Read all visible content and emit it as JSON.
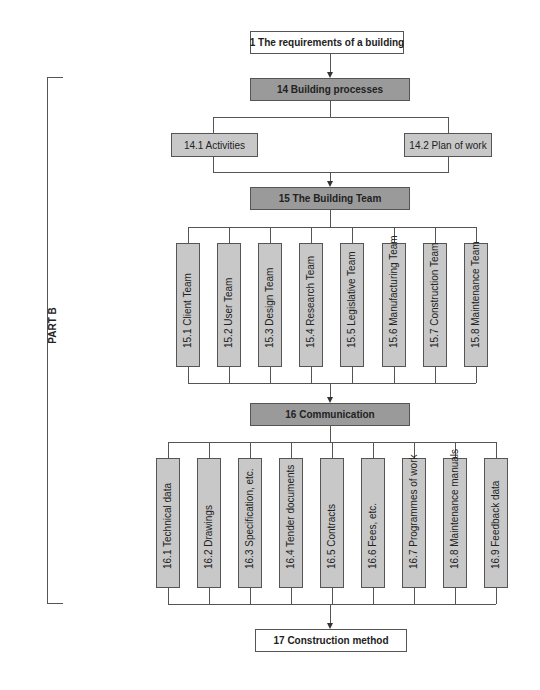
{
  "nodes": {
    "n1": "1  The requirements of a building",
    "n14": "14  Building processes",
    "n14_1": "14.1  Activities",
    "n14_2": "14.2  Plan of work",
    "n15": "15  The Building Team",
    "n16": "16  Communication",
    "n17": "17  Construction method"
  },
  "teams": [
    "15.1  Client Team",
    "15.2  User Team",
    "15.3  Design Team",
    "15.4  Research Team",
    "15.5  Legislative Team",
    "15.6  Manufacturing Team",
    "15.7  Construction Team",
    "15.8  Maintenance Team"
  ],
  "communication": [
    "16.1  Technical data",
    "16.2  Drawings",
    "16.3  Specification, etc.",
    "16.4  Tender documents",
    "16.5  Contracts",
    "16.6  Fees, etc.",
    "16.7  Programmes of work",
    "16.8  Maintenance manuals",
    "16.9  Feedback data"
  ],
  "bracket_label": "PART B",
  "colors": {
    "dark_box": "#9a9a9a",
    "light_box": "#c8c8c8",
    "line": "#555555"
  }
}
